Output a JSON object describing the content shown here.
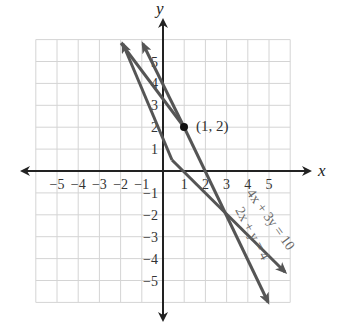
{
  "chart_data": {
    "type": "line",
    "title": "",
    "xlabel": "x",
    "ylabel": "y",
    "xlim": [
      -6,
      6
    ],
    "ylim": [
      -6,
      6
    ],
    "grid": true,
    "x_ticks": [
      "-5",
      "-4",
      "-3",
      "-2",
      "-1",
      "1",
      "2",
      "3",
      "4",
      "5"
    ],
    "y_ticks": [
      "5",
      "4",
      "3",
      "2",
      "1",
      "-1",
      "-2",
      "-3",
      "-4",
      "-5"
    ],
    "series": [
      {
        "name": "4x + 3y = 10",
        "equation": "4x + 3y = 10",
        "points": [
          [
            -2,
            6
          ],
          [
            5.8,
            -4.4
          ]
        ],
        "color": "#555555"
      },
      {
        "name": "2x + y = 4",
        "equation": "2x + y = 4",
        "points": [
          [
            -1,
            6
          ],
          [
            5.05,
            -6.1
          ]
        ],
        "color": "#555555"
      }
    ],
    "annotations": [
      {
        "text": "(1, 2)",
        "point": [
          1,
          2
        ]
      }
    ]
  },
  "labels": {
    "x_axis": "x",
    "y_axis": "y",
    "intersection": "(1, 2)",
    "line1": "4x + 3y = 10",
    "line2": "2x + y = 4"
  }
}
